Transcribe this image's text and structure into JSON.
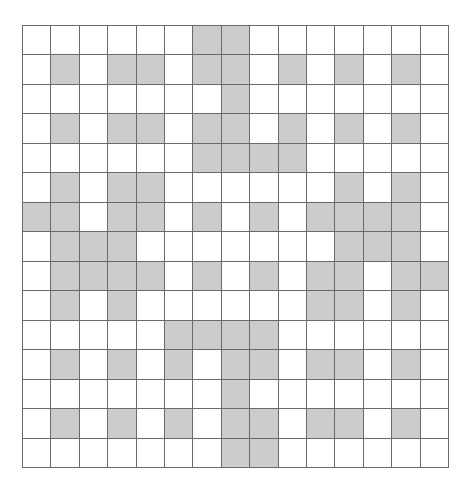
{
  "diagram": {
    "type": "grid-pattern",
    "rows": 15,
    "cols": 15,
    "colors": {
      "filled": "#cccccc",
      "empty": "#ffffff",
      "line": "#6a6a6a"
    },
    "legend": "G = gray/shaded cell, W = white cell",
    "grid": [
      "WWWWWWGGWWWWWWW",
      "WGWGGWGGWGWGWGW",
      "WWWWWWWGWWWWWWW",
      "WGWGGWGGWGWGWGW",
      "WWWWWWGGGGWWWWW",
      "WGWGGWWWWWWGWGW",
      "GGWGGWGWGWGGGGW",
      "WGGGWWWWWWWGGGW",
      "WGGGGWGWGWGGWGG",
      "WGWGWWWWWWGGWGW",
      "WWWWWGGGGWWWWWW",
      "WGWGWGWGGWGGWGW",
      "WWWWWWWGWWWWWWW",
      "WGWGWGWGGWGGWGW",
      "WWWWWWWGGWWWWWW"
    ]
  }
}
